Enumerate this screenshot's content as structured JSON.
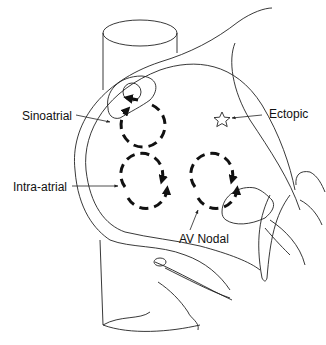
{
  "diagram": {
    "type": "cardiac anatomy schematic",
    "colors": {
      "line": "#222222",
      "arrow": "#111111",
      "background": "#ffffff"
    },
    "labels": {
      "sinoatrial": "Sinoatrial",
      "ectopic": "Ectopic",
      "intra_atrial": "Intra-atrial",
      "av_nodal": "AV Nodal"
    },
    "circuits": [
      {
        "name": "sinoatrial",
        "shape": "dashed-circular-arrow-loop",
        "direction": "clockwise"
      },
      {
        "name": "intra-atrial",
        "shape": "dashed-circular-arrow-loop",
        "direction": "clockwise"
      },
      {
        "name": "av-nodal",
        "shape": "dashed-circular-arrow-loop",
        "direction": "clockwise"
      }
    ],
    "markers": [
      {
        "name": "ectopic-focus",
        "glyph": "☆"
      }
    ]
  }
}
